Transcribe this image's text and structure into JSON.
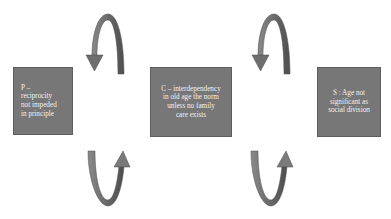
{
  "diagram": {
    "nodes": [
      {
        "id": "P",
        "lines": [
          "P –",
          "reciprocity",
          "not impeded",
          "in principle"
        ]
      },
      {
        "id": "C",
        "lines": [
          "C – interdependency",
          "in old age the norm",
          "unless no family",
          "care exists"
        ]
      },
      {
        "id": "S",
        "lines": [
          "S : Age not",
          "significant as",
          "social division"
        ]
      }
    ],
    "connectors": [
      {
        "between": [
          "P",
          "C"
        ],
        "type": "cyclic-arrow-pair",
        "top_direction": "counter-clockwise-down-left",
        "bottom_direction": "up-right"
      },
      {
        "between": [
          "C",
          "S"
        ],
        "type": "cyclic-arrow-pair",
        "top_direction": "counter-clockwise-down-left",
        "bottom_direction": "up-right"
      }
    ],
    "colors": {
      "box_fill": "#777777",
      "box_border": "#5e5e5e",
      "box_text": "#f2f2f2",
      "arrow_fill": "#6e6e6e",
      "arrow_edge": "#4a4a4a",
      "background": "#ffffff"
    }
  }
}
